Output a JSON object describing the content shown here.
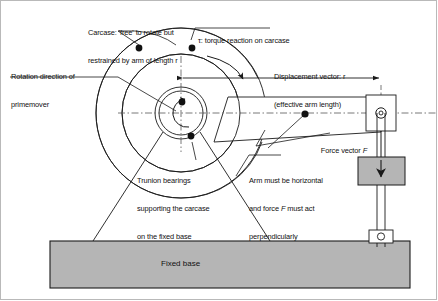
{
  "diagram": {
    "stroke_color": "#1a1a1a",
    "fill_gray": "#b5b5b5",
    "dash_color": "#666666",
    "background": "#ffffff"
  },
  "labels": {
    "carcase": {
      "line1": "Carcase: 'free' to rotate but",
      "line2": "restrained by arm of length r"
    },
    "rotation": {
      "line1": "Rotation direction of",
      "line2": "primemover"
    },
    "torque": {
      "line1": "τ: torque reaction on carcase"
    },
    "displacement": {
      "line1": "Displacement vector: r",
      "line2": "(effective arm length)"
    },
    "trunnion": {
      "line1": "Trunion bearings",
      "line2": "supporting the carcase",
      "line3": "on the fixed base"
    },
    "arm_note": {
      "line1": "Arm must be horizontal",
      "line2_a": "and force ",
      "line2_i": "F",
      "line2_b": " must act",
      "line3": "perpendicularly"
    },
    "force_vector": {
      "prefix": "Force vector ",
      "symbol": "F"
    },
    "fixed_base": "Fixed base"
  },
  "geometry": {
    "hub_center_x": 181,
    "hub_center_y": 113,
    "outer_radius": 85,
    "mid_radius": 59,
    "inner_radius_outer": 26,
    "inner_radius_inner": 22,
    "pivot_x": 381,
    "pivot_y": 113,
    "arm_length_label": "r",
    "base_top_y": 241,
    "base_bottom_y": 288,
    "base_left_x": 50,
    "base_right_x": 410
  },
  "icons": {
    "torque_arc": "curved-arrow-icon",
    "rotation_arc": "curved-arrow-icon",
    "force_arrow": "down-arrow-icon",
    "dimension_arrow": "double-headed-arrow-icon",
    "pivot": "pin-joint-icon",
    "anchor": "pin-joint-icon"
  }
}
